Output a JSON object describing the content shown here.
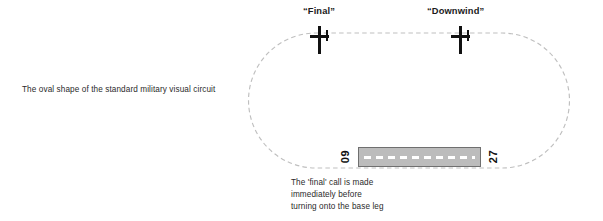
{
  "figure": {
    "left_caption": "The oval shape of the standard military visual circuit",
    "bottom_caption_lines": [
      "The 'final' call is made",
      "immediately before",
      "turning onto the base leg"
    ]
  },
  "callouts": [
    {
      "id": "final",
      "label": "“Final”"
    },
    {
      "id": "downwind",
      "label": "“Downwind”"
    }
  ],
  "aircraft": [
    {
      "id": "final",
      "icon": "aircraft-plan-icon"
    },
    {
      "id": "downwind",
      "icon": "aircraft-plan-icon"
    }
  ],
  "runway": {
    "designator_left": "09",
    "designator_right": "27",
    "surface_color": "#bcbcbc",
    "edge_color": "#6f6f6f",
    "centerline_color": "#ffffff"
  },
  "circuit": {
    "stroke_color": "#bfbfbf",
    "style": "dashed",
    "shape": "oval"
  }
}
